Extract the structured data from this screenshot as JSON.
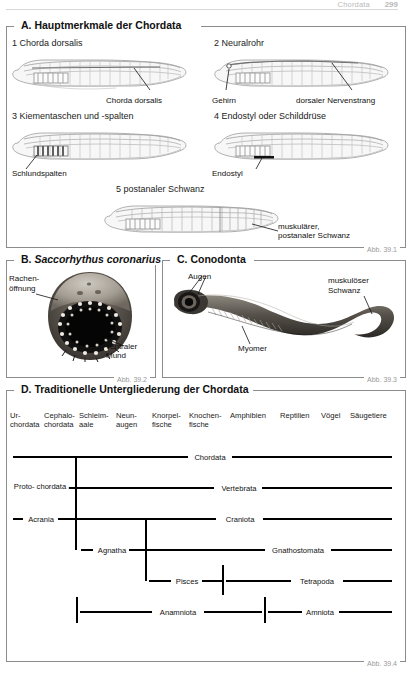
{
  "runhead": {
    "title": "Chordata",
    "page": "299"
  },
  "sections": {
    "A": {
      "title": "A. Hauptmerkmale der Chordata",
      "credit": "Abb. 39.1",
      "panels": [
        {
          "caption": "1 Chorda dorsalis",
          "labels": [
            "Chorda dorsalis"
          ]
        },
        {
          "caption": "2 Neuralrohr",
          "labels": [
            "Gehirn",
            "dorsaler Nervenstrang"
          ]
        },
        {
          "caption": "3 Kiementaschen und -spalten",
          "labels": [
            "Schlundspalten"
          ]
        },
        {
          "caption": "4 Endostyl oder Schilddrüse",
          "labels": [
            "Endostyl"
          ]
        },
        {
          "caption": "5 postanaler Schwanz",
          "labels": [
            "muskulärer,",
            "postanaler Schwanz"
          ]
        }
      ]
    },
    "B": {
      "title_prefix": "B. ",
      "title_italic": "Saccorhythus coronarius",
      "credit": "Abb. 39.2",
      "labels": {
        "mouth_opening": "Rachen-\növnung",
        "l1": "Rachen-",
        "l2": "öffnung",
        "l3": "ventraler",
        "l4": "Mund"
      }
    },
    "C": {
      "title": "C. Conodonta",
      "credit": "Abb. 39.3",
      "labels": {
        "eyes": "Augen",
        "myomer": "Myomer",
        "tail1": "muskulöser",
        "tail2": "Schwanz"
      }
    },
    "D": {
      "title": "D. Traditionelle Untergliederung der Chordata",
      "credit": "Abb. 39.4",
      "columns": [
        "Ur-\nchordata",
        "Cephalo-\nchordata",
        "Schleim-\naale",
        "Neun-\naugen",
        "Knorpel-\nfische",
        "Knochen-\nfische",
        "Amphibien",
        "Reptilien",
        "Vögel",
        "Säugetiere"
      ],
      "taxa": [
        "Chordata",
        "Proto-\nchordata",
        "Vertebrata",
        "Acrania",
        "Craniota",
        "Agnatha",
        "Gnathostomata",
        "Pisces",
        "Tetrapoda",
        "Anamniota",
        "Amniota"
      ]
    }
  },
  "colors": {
    "rule": "#d8d8d8",
    "frame": "#8c8c8c",
    "bar": "#000000",
    "credit": "#9a9a9a",
    "runhead": "#b9b9b9"
  }
}
